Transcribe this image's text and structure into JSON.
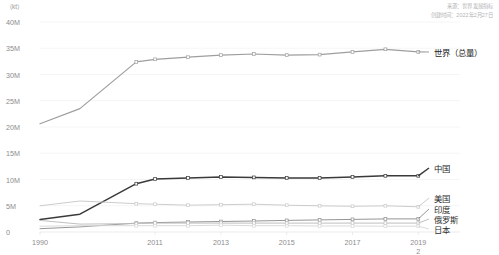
{
  "unit_label": "（kt）",
  "attribution": {
    "source": "来源：世界发展指标",
    "created": "创建时间：2022年2月27日"
  },
  "axis": {
    "y_ticks": [
      "0",
      "5M",
      "10M",
      "15M",
      "20M",
      "25M",
      "30M",
      "35M",
      "40M"
    ],
    "x_ticks": [
      "1990",
      "2011",
      "2013",
      "2015",
      "2017",
      "2019"
    ],
    "x_tick_overflow": "2"
  },
  "series_labels": {
    "world": "世界（总量）",
    "china": "中国",
    "usa": "美国",
    "india": "印度",
    "russia": "俄罗斯",
    "japan": "日本"
  },
  "colors": {
    "world": "#9e9e9e",
    "china": "#3a3a3a",
    "usa": "#c9c9c9",
    "india": "#8f8f8f",
    "russia": "#bdbdbd",
    "japan": "#d8d8d8",
    "grid": "#eeeeee",
    "axis": "#e2e2e2",
    "tick_text": "#8c8c8c",
    "label_text": "#2f2f2f",
    "attrib_text": "#b3b3b3"
  },
  "chart_data": {
    "type": "line",
    "title": "",
    "xlabel": "",
    "ylabel": "（kt）",
    "ylim": [
      0,
      40000000
    ],
    "grid": true,
    "legend_position": "right-inline-labels",
    "x": [
      "1990",
      "2000",
      "2010",
      "2011",
      "2012",
      "2013",
      "2014",
      "2015",
      "2016",
      "2017",
      "2018",
      "2019"
    ],
    "x_tick_labels": [
      "1990",
      "2011",
      "2013",
      "2015",
      "2017",
      "2019"
    ],
    "series": [
      {
        "name": "世界（总量）",
        "color": "#9e9e9e",
        "values": [
          20600000,
          23500000,
          32400000,
          32900000,
          33300000,
          33700000,
          33900000,
          33700000,
          33800000,
          34300000,
          34800000,
          34300000
        ]
      },
      {
        "name": "中国",
        "color": "#3a3a3a",
        "values": [
          2400000,
          3400000,
          9200000,
          10100000,
          10300000,
          10500000,
          10400000,
          10300000,
          10300000,
          10500000,
          10700000,
          10700000
        ]
      },
      {
        "name": "美国",
        "color": "#c9c9c9",
        "values": [
          5000000,
          5900000,
          5400000,
          5300000,
          5100000,
          5200000,
          5300000,
          5100000,
          5000000,
          4900000,
          5000000,
          4800000
        ]
      },
      {
        "name": "印度",
        "color": "#8f8f8f",
        "values": [
          620000,
          980000,
          1700000,
          1800000,
          1900000,
          2000000,
          2100000,
          2200000,
          2300000,
          2400000,
          2500000,
          2500000
        ]
      },
      {
        "name": "俄罗斯",
        "color": "#bdbdbd",
        "values": [
          2200000,
          1500000,
          1600000,
          1700000,
          1700000,
          1700000,
          1700000,
          1700000,
          1700000,
          1700000,
          1700000,
          1700000
        ]
      },
      {
        "name": "日本",
        "color": "#d8d8d8",
        "values": [
          1100000,
          1200000,
          1200000,
          1200000,
          1200000,
          1300000,
          1200000,
          1200000,
          1150000,
          1150000,
          1100000,
          1100000
        ]
      }
    ]
  }
}
